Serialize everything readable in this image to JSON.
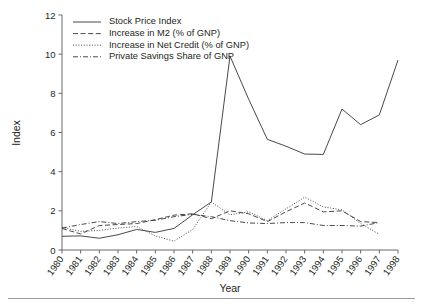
{
  "chart_data": {
    "type": "line",
    "title": "",
    "xlabel": "Year",
    "ylabel": "Index",
    "xlim": [
      1980,
      1998
    ],
    "ylim": [
      0,
      12
    ],
    "grid": false,
    "legend_position": "top-left inside axes",
    "x": [
      1980,
      1981,
      1982,
      1983,
      1984,
      1985,
      1986,
      1987,
      1988,
      1989,
      1990,
      1991,
      1992,
      1993,
      1994,
      1995,
      1996,
      1997,
      1998
    ],
    "xtick_labels": [
      "1980",
      "1981",
      "1982",
      "1983",
      "1984",
      "1985",
      "1986",
      "1987",
      "1988",
      "1989",
      "1990",
      "1991",
      "1992",
      "1993",
      "1994",
      "1995",
      "1996",
      "1997",
      "1998"
    ],
    "ytick_labels": [
      "0",
      "2",
      "4",
      "6",
      "8",
      "10",
      "12"
    ],
    "yticks": [
      0,
      2,
      4,
      6,
      8,
      10,
      12
    ],
    "series": [
      {
        "name": "Stock Price Index",
        "style": "solid",
        "x": [
          1980,
          1981,
          1982,
          1983,
          1984,
          1985,
          1986,
          1987,
          1988,
          1989,
          1990,
          1991,
          1992,
          1993,
          1994,
          1995,
          1996,
          1997,
          1998
        ],
        "values": [
          0.7,
          0.72,
          0.6,
          0.78,
          1.05,
          0.9,
          1.1,
          1.8,
          2.45,
          9.9,
          7.7,
          5.65,
          5.3,
          4.9,
          4.88,
          7.2,
          6.4,
          6.9,
          9.7
        ]
      },
      {
        "name": "Increase in M2 (% of GNP)",
        "style": "dashed",
        "x": [
          1980,
          1981,
          1982,
          1983,
          1984,
          1985,
          1986,
          1987,
          1988,
          1989,
          1990,
          1991,
          1992,
          1993,
          1994,
          1995,
          1996,
          1997
        ],
        "values": [
          1.1,
          0.82,
          1.25,
          1.3,
          1.35,
          1.55,
          1.78,
          1.85,
          1.6,
          2.0,
          1.85,
          1.45,
          1.95,
          2.4,
          1.95,
          2.0,
          1.45,
          1.4
        ]
      },
      {
        "name": "Increase in Net Credit (% of GNP)",
        "style": "dotted",
        "x": [
          1980,
          1981,
          1982,
          1983,
          1984,
          1985,
          1986,
          1987,
          1988,
          1989,
          1990,
          1991,
          1992,
          1993,
          1994,
          1995,
          1996,
          1997
        ],
        "values": [
          1.15,
          0.95,
          1.0,
          1.12,
          1.2,
          0.72,
          0.45,
          1.05,
          2.45,
          1.8,
          1.95,
          1.5,
          2.1,
          2.7,
          2.2,
          2.05,
          1.35,
          0.8
        ]
      },
      {
        "name": "Private Savings Share of GNP",
        "style": "dashdot",
        "x": [
          1980,
          1981,
          1982,
          1983,
          1984,
          1985,
          1986,
          1987,
          1988,
          1989,
          1990,
          1991,
          1992,
          1993,
          1994,
          1995,
          1996,
          1997
        ],
        "values": [
          1.12,
          1.3,
          1.45,
          1.35,
          1.45,
          1.52,
          1.7,
          1.82,
          1.7,
          1.5,
          1.38,
          1.35,
          1.4,
          1.4,
          1.25,
          1.25,
          1.22,
          1.4
        ]
      }
    ]
  },
  "legend": {
    "items": [
      {
        "label": "Stock Price Index",
        "style": "solid"
      },
      {
        "label": "Increase in M2 (% of GNP)",
        "style": "dashed"
      },
      {
        "label": "Increase in Net Credit (% of GNP)",
        "style": "dotted"
      },
      {
        "label": "Private Savings Share of GNP",
        "style": "dashdot"
      }
    ]
  },
  "axes": {
    "y_title": "Index",
    "x_title": "Year"
  },
  "colors": {
    "ink": "#231f20",
    "line": "#3f3f41",
    "axis": "#58595b",
    "rule": "#9a9a9c",
    "background": "#ffffff"
  }
}
